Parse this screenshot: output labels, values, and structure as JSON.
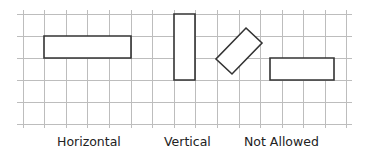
{
  "diagram": {
    "grid": {
      "color": "#bdbdbd",
      "vertical_lines_x": [
        23,
        44,
        66,
        87,
        109,
        131,
        152,
        174,
        195,
        217,
        239,
        260,
        282,
        303,
        325,
        346
      ],
      "horizontal_lines_y": [
        14,
        36,
        58,
        80,
        102,
        124
      ],
      "x_start": 17,
      "x_end": 352
    },
    "shapes": [
      {
        "name": "horizontal-rectangle",
        "points": "44,36 131,36 131,58 44,58"
      },
      {
        "name": "vertical-rectangle",
        "points": "174,14 195,14 195,80 174,80"
      },
      {
        "name": "rotated-rectangle",
        "points": "246,28 262,43 232,74 216,59"
      },
      {
        "name": "offset-horizontal-rectangle",
        "points": "270,58 334,58 334,80 270,80"
      }
    ],
    "stroke_color": "#333333"
  },
  "labels": {
    "horizontal": "Horizontal",
    "vertical": "Vertical",
    "not_allowed": "Not Allowed"
  }
}
